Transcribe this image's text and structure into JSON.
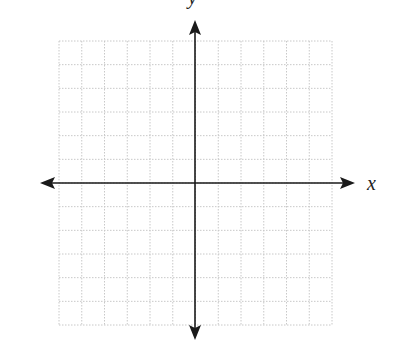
{
  "diagram": {
    "type": "coordinate-plane",
    "grid": {
      "columns": 12,
      "rows": 12,
      "style": "dotted",
      "color": "#c8c8c8"
    },
    "axes": {
      "x_label": "x",
      "y_label": "y",
      "color": "#1a1a1a",
      "arrows": "both-ends"
    }
  },
  "layout": {
    "grid_left": 59,
    "grid_top": 41,
    "grid_right": 332,
    "grid_bottom": 325,
    "origin_x": 195,
    "origin_y": 183,
    "x_axis_start": 40,
    "x_axis_end": 355,
    "y_axis_start": 20,
    "y_axis_end": 340
  }
}
